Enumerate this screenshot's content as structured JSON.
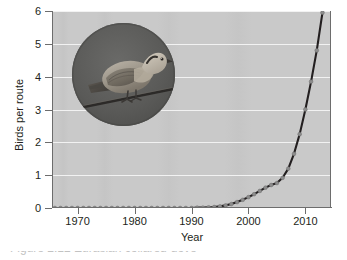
{
  "figure": {
    "caption_partial": "Figure 2.12 Eurasian collared-dove",
    "inset_photo": {
      "subject": "Eurasian collared-dove perched on a wire",
      "shape": "circle"
    }
  },
  "chart_data": {
    "type": "line",
    "title": "",
    "xlabel": "Year",
    "ylabel": "Birds per route",
    "xlim": [
      1965.5,
      2014.5
    ],
    "ylim": [
      0,
      6
    ],
    "xticks": [
      1970,
      1980,
      1990,
      2000,
      2010
    ],
    "yticks": [
      0,
      1,
      2,
      3,
      4,
      5,
      6
    ],
    "grid": "horizontal",
    "legend": "none",
    "marker": "circle",
    "line_color": "#231f20",
    "marker_color": "#8c8c8c",
    "plot_background": "#c9c9c9",
    "gridline_color": "#f2f2f2",
    "x": [
      1966,
      1967,
      1968,
      1969,
      1970,
      1971,
      1972,
      1973,
      1974,
      1975,
      1976,
      1977,
      1978,
      1979,
      1980,
      1981,
      1982,
      1983,
      1984,
      1985,
      1986,
      1987,
      1988,
      1989,
      1990,
      1991,
      1992,
      1993,
      1994,
      1995,
      1996,
      1997,
      1998,
      1999,
      2000,
      2001,
      2002,
      2003,
      2004,
      2005,
      2006,
      2007,
      2008,
      2009,
      2010,
      2011,
      2012,
      2013
    ],
    "values": [
      0.0,
      0.0,
      0.0,
      0.0,
      0.0,
      0.0,
      0.0,
      0.0,
      0.0,
      0.0,
      0.0,
      0.0,
      0.0,
      0.0,
      0.0,
      0.0,
      0.0,
      0.0,
      0.0,
      0.0,
      0.0,
      0.0,
      0.0,
      0.0,
      0.0,
      0.01,
      0.01,
      0.02,
      0.03,
      0.05,
      0.08,
      0.12,
      0.18,
      0.25,
      0.33,
      0.42,
      0.52,
      0.62,
      0.7,
      0.76,
      0.92,
      1.2,
      1.65,
      2.25,
      3.0,
      3.85,
      4.8,
      5.95
    ]
  }
}
